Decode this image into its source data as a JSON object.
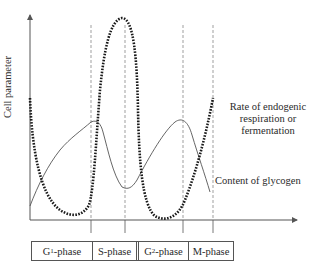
{
  "diagram": {
    "y_axis_label": "Cell parameter",
    "curves": [
      {
        "name": "Rate of endogenic respiration or fermentation",
        "style": "dotted",
        "label_lines": [
          "Rate of endogenic",
          "respiration or",
          "fermentation"
        ]
      },
      {
        "name": "Content of glycogen",
        "style": "solid",
        "label": "Content of glycogen"
      }
    ],
    "phases": [
      {
        "prefix": "G",
        "sub": "1",
        "suffix": "-phase"
      },
      {
        "prefix": "S-phase",
        "sub": "",
        "suffix": ""
      },
      {
        "prefix": "G",
        "sub": "2",
        "suffix": "-phase"
      },
      {
        "prefix": "M-phase",
        "sub": "",
        "suffix": ""
      }
    ],
    "colors": {
      "line": "#555555",
      "dotted": "#1a1a1a",
      "text": "#2a2a2a"
    }
  }
}
